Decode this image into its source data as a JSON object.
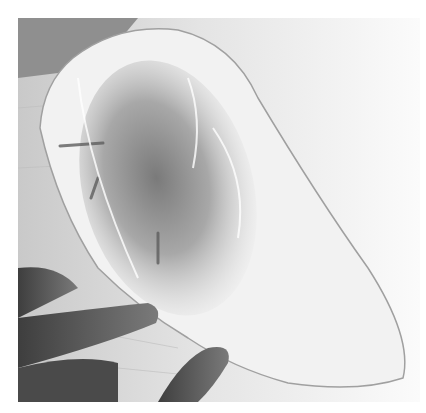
{
  "image": {
    "description": "Grayscale photograph of a clear plastic bag containing a seasoned piece of food, held flat on a wooden board by fingers at lower left",
    "colors": {
      "background": "#ffffff",
      "board_light": "#ececec",
      "board_dark": "#9a9a9a",
      "bag_highlight": "#f4f4f4",
      "contents_dark": "#6e6e6e",
      "hand": "#5a5a5a"
    }
  }
}
